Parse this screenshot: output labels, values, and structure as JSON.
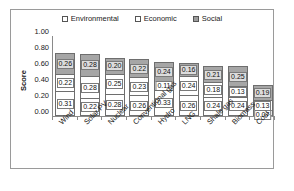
{
  "chart_data": {
    "type": "bar",
    "stacked": true,
    "title": "",
    "xlabel": "",
    "ylabel": "Score",
    "ylim": [
      0.0,
      1.0
    ],
    "ytick_step": 0.2,
    "ytick_labels": [
      "1.00",
      "0.80",
      "0.60",
      "0.40",
      "0.20",
      "0.00"
    ],
    "grid": false,
    "legend_position": "top-center",
    "categories": [
      "Wind",
      "Solar PV",
      "Nuclear",
      "Conventional gas",
      "Hydro",
      "LNG",
      "Shale gas",
      "Biomass",
      "Coal"
    ],
    "series": [
      {
        "name": "Environmental",
        "color": "#ffffff",
        "values": [
          0.31,
          0.22,
          0.28,
          0.26,
          0.33,
          0.26,
          0.24,
          0.24,
          0.07
        ],
        "labels": [
          "0.31",
          "0.22",
          "0.28",
          "0.26",
          "0.33",
          "0.26",
          "0.24",
          "0.24",
          "0.07"
        ]
      },
      {
        "name": "Economic",
        "color": "#ffffff",
        "values": [
          0.22,
          0.28,
          0.25,
          0.23,
          0.11,
          0.24,
          0.18,
          0.13,
          0.13
        ],
        "labels": [
          "0.22",
          "0.28",
          "0.25",
          "0.23",
          "0.11",
          "0.24",
          "0.18",
          "0.13",
          "0.13"
        ]
      },
      {
        "name": "Social",
        "color": "#a6a6a6",
        "values": [
          0.26,
          0.28,
          0.2,
          0.22,
          0.24,
          0.16,
          0.21,
          0.25,
          0.19
        ],
        "labels": [
          "0.26",
          "0.28",
          "0.20",
          "0.22",
          "0.24",
          "0.16",
          "0.21",
          "0.25",
          "0.19"
        ]
      }
    ],
    "totals": [
      0.79,
      0.78,
      0.73,
      0.71,
      0.68,
      0.66,
      0.63,
      0.62,
      0.39
    ]
  },
  "legend": {
    "items": [
      {
        "label": "Environmental",
        "swatch": "legend-swatch-environmental"
      },
      {
        "label": "Economic",
        "swatch": "legend-swatch-economic"
      },
      {
        "label": "Social",
        "swatch": "legend-swatch-social"
      }
    ]
  },
  "caption": {
    "text": ""
  }
}
